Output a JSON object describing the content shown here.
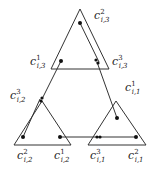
{
  "diagram": {
    "triangles": [
      {
        "id": "top",
        "points": [
          [
            80,
            9
          ],
          [
            51,
            69
          ],
          [
            109,
            69
          ]
        ]
      },
      {
        "id": "left",
        "points": [
          [
            42,
            101
          ],
          [
            14,
            145
          ],
          [
            71,
            145
          ]
        ]
      },
      {
        "id": "right",
        "points": [
          [
            116,
            101
          ],
          [
            88,
            145
          ],
          [
            146,
            145
          ]
        ]
      }
    ],
    "nodes": [
      {
        "id": "c2_i3",
        "x": 80,
        "y": 23
      },
      {
        "id": "c1_i3",
        "x": 61,
        "y": 61
      },
      {
        "id": "c3_i3",
        "x": 97,
        "y": 62
      },
      {
        "id": "c3_i2",
        "x": 42,
        "y": 99
      },
      {
        "id": "c2_i2",
        "x": 23,
        "y": 137
      },
      {
        "id": "c1_i2",
        "x": 60,
        "y": 137
      },
      {
        "id": "c3_i1",
        "x": 98,
        "y": 137
      },
      {
        "id": "c2_i1",
        "x": 136,
        "y": 137
      },
      {
        "id": "c1_i1",
        "x": 117,
        "y": 118
      }
    ],
    "edges": [
      {
        "from": "c2_i3",
        "to": "c3_i3",
        "offset": true
      },
      {
        "from": "c3_i3",
        "to": "c1_i1"
      },
      {
        "from": "c1_i3",
        "to": "c3_i2"
      },
      {
        "from": "c3_i2",
        "to": "c2_i2",
        "offset": true
      },
      {
        "from": "c1_i2",
        "to": "c3_i1"
      },
      {
        "from": "c3_i1",
        "to": "c2_i1"
      }
    ],
    "labels": {
      "c2_i3": {
        "base": "c",
        "sup": "2",
        "sub": "i,3"
      },
      "c1_i3": {
        "base": "c",
        "sup": "1",
        "sub": "i,3"
      },
      "c3_i3": {
        "base": "c",
        "sup": "3",
        "sub": "i,3"
      },
      "c3_i2": {
        "base": "c",
        "sup": "3",
        "sub": "i,2"
      },
      "c1_i1": {
        "base": "c",
        "sup": "1",
        "sub": "i,1"
      },
      "c2_i2": {
        "base": "c",
        "sup": "2",
        "sub": "i,2"
      },
      "c1_i2": {
        "base": "c",
        "sup": "1",
        "sub": "i,2"
      },
      "c3_i1": {
        "base": "c",
        "sup": "3",
        "sub": "i,1"
      },
      "c2_i1": {
        "base": "c",
        "sup": "2",
        "sub": "i,1"
      }
    },
    "stroke_color": "#333333",
    "node_color": "#111111"
  }
}
